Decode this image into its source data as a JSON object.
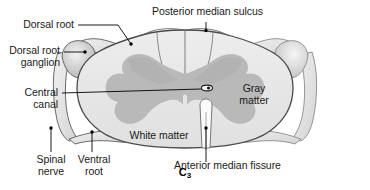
{
  "figure": {
    "caption_main": "C",
    "caption_sub": "3",
    "segment_level": "C3"
  },
  "labels": {
    "posterior_median_sulcus": "Posterior median sulcus",
    "dorsal_root": "Dorsal root",
    "dorsal_root_ganglion_line1": "Dorsal root",
    "dorsal_root_ganglion_line2": "ganglion",
    "central_canal_line1": "Central",
    "central_canal_line2": "canal",
    "gray_matter_line1": "Gray",
    "gray_matter_line2": "matter",
    "white_matter": "White matter",
    "anterior_median_fissure": "Anterior median fissure",
    "spinal_nerve_line1": "Spinal",
    "spinal_nerve_line2": "nerve",
    "ventral_root_line1": "Ventral",
    "ventral_root_line2": "root"
  },
  "colors": {
    "white_matter_fill": "#e8e8e8",
    "gray_matter_fill": "#b9b9b9",
    "nerve_fill": "#e2e2e2",
    "ganglion_fill": "#c9c9c9",
    "outline": "#4a4a4a",
    "leader_line": "#000000",
    "background": "#ffffff",
    "text": "#1a1a1a"
  },
  "structures": [
    "spinal cord outline",
    "white matter",
    "gray matter",
    "central canal",
    "anterior median fissure",
    "posterior median sulcus",
    "dorsal root",
    "dorsal root ganglion",
    "ventral root",
    "spinal nerve"
  ]
}
